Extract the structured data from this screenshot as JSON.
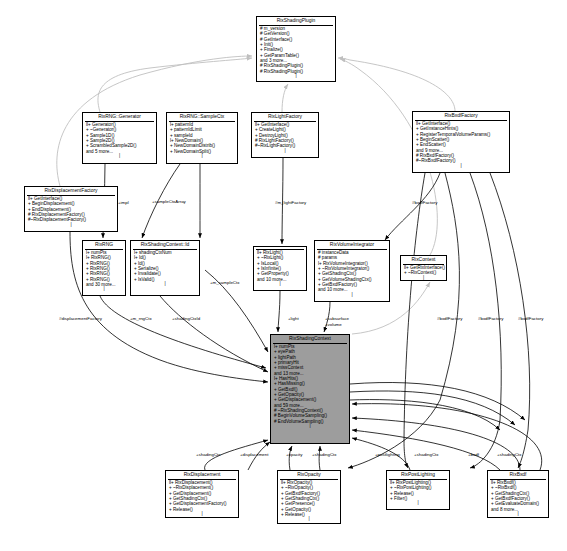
{
  "diagram": {
    "type": "uml-collaboration-diagram",
    "background": "#ffffff",
    "highlight_color": "#9d9d9d",
    "edge_color": "#000000",
    "inherit_edge_color": "#bfbfbf"
  },
  "nodes": [
    {
      "id": "rixshadingplugin",
      "name": "RixShadingPlugin",
      "x": 256,
      "y": 16,
      "w": 80,
      "h": 66,
      "highlight": false,
      "members": [
        "# m_version",
        "# GetVersion()",
        "# GetInterface()",
        "+ Init()",
        "+ Finalize()",
        "+ GetParamTable()",
        "and 3 more...",
        "# RixShadingPlugin()",
        "# RixShadingPlugin()"
      ]
    },
    {
      "id": "rixrng-generator",
      "name": "RixRNG::Generator",
      "x": 82,
      "y": 112,
      "w": 75,
      "h": 52,
      "highlight": false,
      "members": [
        "ll+ Generator()",
        "+ ~Generator()",
        "+ Sample1D()",
        "+ Sample2D()",
        "+ ScrambledSample2D()",
        "and 5 more..."
      ]
    },
    {
      "id": "rixrng-samplectx",
      "name": "RixRNG::SampleCtx",
      "x": 166,
      "y": 112,
      "w": 72,
      "h": 52,
      "highlight": false,
      "members": [
        "l+ patternId",
        "+ patternIdLimit",
        "+ sampleId",
        "l+ NewDomain()",
        "+ NewDomainDistrib()",
        "+ NewDomainSplit()"
      ]
    },
    {
      "id": "rixlightfactory",
      "name": "RixLightFactory",
      "x": 251,
      "y": 112,
      "w": 68,
      "h": 46,
      "highlight": false,
      "members": [
        "ll+ GetInterface()",
        "+ CreateLight()",
        "+ DestroyLight()",
        "# RixLightFactory()",
        "#~RixLightFactory()"
      ]
    },
    {
      "id": "rixbxdffactory",
      "name": "RixBxdfFactory",
      "x": 412,
      "y": 111,
      "w": 98,
      "h": 62,
      "highlight": false,
      "members": [
        "ll+ GetInterface()",
        "+ GetInstanceHints()",
        "+ RegisterTemporalVolumeParams()",
        "+ BeginScatter()",
        "+ EndScatter()",
        "and 9 more...",
        "# RixBxdfFactory()",
        "#~RixBxdfFactory()"
      ]
    },
    {
      "id": "rixdisplacementfactory",
      "name": "RixDisplacementFactory",
      "x": 24,
      "y": 186,
      "w": 94,
      "h": 46,
      "highlight": false,
      "members": [
        "ll+ GetInterface()",
        "+ BeginDisplacement()",
        "+ EndDisplacement()",
        "# RixDisplacementFactory()",
        "#~RixDisplacementFactory()"
      ]
    },
    {
      "id": "rixrng",
      "name": "RixRNG",
      "x": 82,
      "y": 240,
      "w": 44,
      "h": 56,
      "highlight": false,
      "members": [
        "l+ numPts",
        "l+ RixRNG()",
        "+ RixRNG()",
        "+ RixRNG()",
        "+ RixRNG()",
        "+ RixRNG()",
        "and 30 more..."
      ]
    },
    {
      "id": "rixshadingcontext-id",
      "name": "RixShadingContext::Id",
      "x": 130,
      "y": 240,
      "w": 70,
      "h": 56,
      "highlight": false,
      "members": [
        "l+ shadingCtxNum",
        "l+ Id()",
        "+ Id()",
        "+ Serialize()",
        "+ Invalidate()",
        "+ IsValid()"
      ]
    },
    {
      "id": "rixlight",
      "name": "",
      "x": 253,
      "y": 246,
      "w": 54,
      "h": 45,
      "highlight": false,
      "members": [
        "ll+ RixLight()",
        "+ ~RixLight()",
        "+ IsLocal()",
        "+ IsInfinite()",
        "+ GetProperty()",
        "and 10 more..."
      ]
    },
    {
      "id": "rixvolumeintegrator",
      "name": "RixVolumeIntegrator",
      "x": 314,
      "y": 240,
      "w": 76,
      "h": 62,
      "highlight": false,
      "members": [
        "# instanceData",
        "# params",
        "l+ RixVolumeIntegrator()",
        "+ ~RixVolumeIntegrator()",
        "+ GetShadingCtx()",
        "+ GetVolumeShadingCtx()",
        "+ GetBxdfFactory()",
        "and 10 more..."
      ]
    },
    {
      "id": "rixcontext",
      "name": "RixContext",
      "x": 400,
      "y": 255,
      "w": 47,
      "h": 26,
      "highlight": false,
      "members": [
        "ll+ GetRixInterface()",
        "+ ~RixContext()"
      ]
    },
    {
      "id": "rixshadingcontext",
      "name": "RixShadingContext",
      "x": 270,
      "y": 334,
      "w": 80,
      "h": 110,
      "highlight": true,
      "members": [
        "l+ numPts",
        "+ eyePath",
        "+ lightPath",
        "+ primaryHit",
        "+ missContext",
        "and 13 more...",
        "l+ HasHits()",
        "+ HasMissing()",
        "+ GetBxdf()",
        "+ GetOpacity()",
        "+ GetDisplacement()",
        "and 59 more...",
        "# ~RixShadingContext()",
        "# BeginVolumeSampling()",
        "# EndVolumeSampling()"
      ]
    },
    {
      "id": "rixdisplacement",
      "name": "RixDisplacement",
      "x": 165,
      "y": 470,
      "w": 74,
      "h": 48,
      "highlight": false,
      "members": [
        "ll+ RixDisplacement()",
        "+ ~RixDisplacement()",
        "+ GetDisplacement()",
        "+ GetShadingCtx()",
        "+ GetDisplacementFactory()",
        "+ Release()"
      ]
    },
    {
      "id": "rixopacity",
      "name": "RixOpacity",
      "x": 277,
      "y": 470,
      "w": 64,
      "h": 54,
      "highlight": false,
      "members": [
        "ll+ RixOpacity()",
        "+ ~RixOpacity()",
        "+ GetBxdfFactory()",
        "+ GetShadingCtx()",
        "+ GetPresence()",
        "+ GetOpacity()",
        "+ Release()"
      ]
    },
    {
      "id": "rixpostlighting",
      "name": "RixPostLighting",
      "x": 386,
      "y": 470,
      "w": 64,
      "h": 40,
      "highlight": false,
      "members": [
        "ll+ RixPostLighting()",
        "+ ~RixPostLighting()",
        "+ Release()",
        "+ Filter()"
      ]
    },
    {
      "id": "rixbxdf",
      "name": "RixBxdf",
      "x": 487,
      "y": 470,
      "w": 62,
      "h": 48,
      "highlight": false,
      "members": [
        "ll+ RixBxdf()",
        "+ ~RixBxdf()",
        "+ GetShadingCtx()",
        "+ GetBxdfFactory()",
        "+ GetEvaluateDomain()",
        "and 8 more..."
      ]
    }
  ],
  "edge_labels": [
    {
      "id": "impl",
      "text": "+impl",
      "x": 118,
      "y": 200
    },
    {
      "id": "samplectxarray",
      "text": "+sampleCtxArray",
      "x": 152,
      "y": 199
    },
    {
      "id": "m-lightfactory",
      "text": "#m_lightFactory",
      "x": 275,
      "y": 200
    },
    {
      "id": "bxdffactory-top",
      "text": "#bxdfFactory",
      "x": 412,
      "y": 200
    },
    {
      "id": "m-samplectx",
      "text": "+m_sampleCtx",
      "x": 210,
      "y": 280
    },
    {
      "id": "displacementfactory",
      "text": "#displacementFactory",
      "x": 59,
      "y": 316
    },
    {
      "id": "m-rngctx",
      "text": "+m_rngCtx",
      "x": 130,
      "y": 316
    },
    {
      "id": "shadingctxid",
      "text": "+shadingCtxId",
      "x": 172,
      "y": 316
    },
    {
      "id": "light",
      "text": "+light",
      "x": 288,
      "y": 316
    },
    {
      "id": "subsurface",
      "text": "+subsurface",
      "x": 325,
      "y": 316
    },
    {
      "id": "volume",
      "text": "+volume",
      "x": 325,
      "y": 322
    },
    {
      "id": "bxdffactory-r1",
      "text": "#bxdfFactory",
      "x": 437,
      "y": 316
    },
    {
      "id": "bxdffactory-r2",
      "text": "#bxdfFactory",
      "x": 478,
      "y": 316
    },
    {
      "id": "bxdffactory-r3",
      "text": "#bxdfFactory",
      "x": 518,
      "y": 316
    },
    {
      "id": "shadingctx-1",
      "text": "+shadingCtx",
      "x": 196,
      "y": 452
    },
    {
      "id": "displacement",
      "text": "+displacement",
      "x": 240,
      "y": 452
    },
    {
      "id": "opacity",
      "text": "+opacity",
      "x": 286,
      "y": 452
    },
    {
      "id": "shadingctx-2",
      "text": "+shadingCtx",
      "x": 312,
      "y": 452
    },
    {
      "id": "postlighting",
      "text": "+postlighting",
      "x": 375,
      "y": 452
    },
    {
      "id": "shadingctx-3",
      "text": "+shadingCtx",
      "x": 414,
      "y": 452
    },
    {
      "id": "bxdf",
      "text": "+bxdf",
      "x": 468,
      "y": 452
    },
    {
      "id": "shadingctx-4",
      "text": "+shadingCtx",
      "x": 497,
      "y": 452
    }
  ]
}
